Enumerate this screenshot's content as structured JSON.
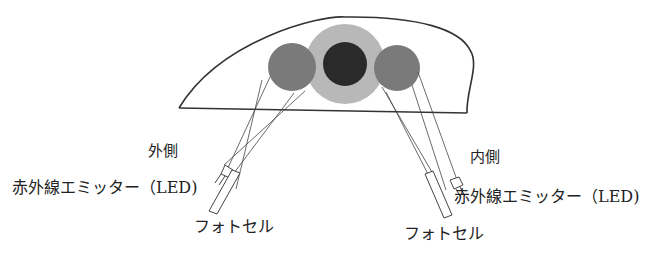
{
  "diagram": {
    "labels": {
      "outer_side": "外側",
      "inner_side": "内側",
      "emitter_left": "赤外線エミッター（LED)",
      "emitter_right": "赤外線エミッター（LED)",
      "photocell_left": "フォトセル",
      "photocell_right": "フォトセル"
    },
    "colors": {
      "outline": "#333333",
      "outer_disc": "#b8b8b8",
      "center_disc": "#2a2a2a",
      "side_discs": "#7a7a7a",
      "background": "#ffffff"
    }
  }
}
